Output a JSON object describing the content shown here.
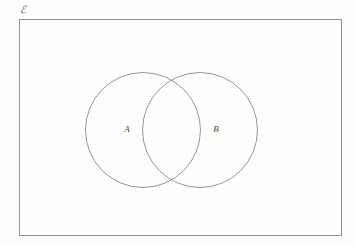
{
  "diagram": {
    "type": "venn",
    "background_color": "#fefefe",
    "stroke_color": "#8a8a8a",
    "text_color": "#4a4a4a",
    "universe": {
      "label": "ℰ",
      "label_x": 23,
      "label_y": 11,
      "rect": {
        "x": 19,
        "y": 19,
        "width": 322,
        "height": 216
      },
      "stroke_color": "#8f8f8f",
      "stroke_width": 1
    },
    "sets": [
      {
        "name": "set-a",
        "label": "A",
        "cx": 143,
        "cy": 130,
        "r": 57.5,
        "label_x": 127,
        "label_y": 130,
        "stroke_color": "#8a8a8a",
        "stroke_width": 0.9,
        "fill": "none"
      },
      {
        "name": "set-b",
        "label": "B",
        "cx": 200,
        "cy": 130,
        "r": 57.5,
        "label_x": 216,
        "label_y": 130,
        "stroke_color": "#8a8a8a",
        "stroke_width": 0.9,
        "fill": "none"
      }
    ]
  }
}
